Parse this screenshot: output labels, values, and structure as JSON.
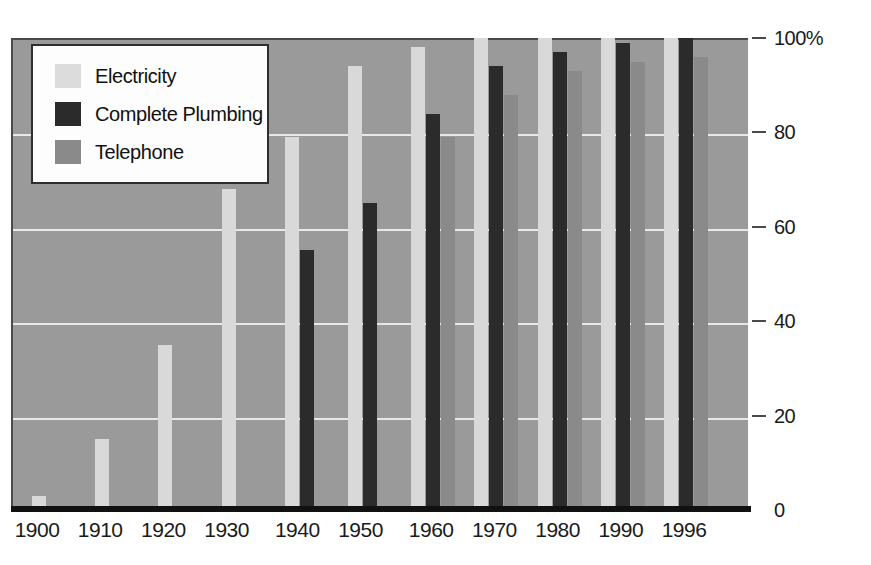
{
  "chart_data": {
    "type": "bar",
    "title": "",
    "subtitle": "",
    "xlabel": "",
    "ylabel": "",
    "ylim": [
      0,
      100
    ],
    "yticks": [
      0,
      20,
      40,
      60,
      80,
      100
    ],
    "ytick_labels": [
      "0",
      "20",
      "40",
      "60",
      "80",
      "100%"
    ],
    "grid": true,
    "legend_position": "top-left",
    "categories": [
      "1900",
      "1910",
      "1920",
      "1930",
      "1940",
      "1950",
      "1960",
      "1970",
      "1980",
      "1990",
      "1996"
    ],
    "series": [
      {
        "name": "Electricity",
        "color": "#d9d9d9",
        "values": [
          3,
          15,
          35,
          68,
          79,
          94,
          98,
          100,
          100,
          100,
          100
        ]
      },
      {
        "name": "Complete Plumbing",
        "color": "#2b2b2b",
        "values": [
          null,
          null,
          null,
          null,
          55,
          65,
          84,
          94,
          97,
          99,
          100
        ]
      },
      {
        "name": "Telephone",
        "color": "#8a8a8a",
        "values": [
          null,
          null,
          null,
          null,
          null,
          null,
          79,
          88,
          93,
          95,
          96
        ]
      }
    ]
  },
  "legend": {
    "items": [
      {
        "label": "Electricity",
        "swatch": "elec"
      },
      {
        "label": "Complete Plumbing",
        "swatch": "plumb"
      },
      {
        "label": "Telephone",
        "swatch": "tel"
      }
    ]
  },
  "colors": {
    "plot_background": "#9a9a9a",
    "gridline": "#e8e8e8",
    "baseline": "#111111",
    "frame": "#4a4a4a",
    "electricity": "#d9d9d9",
    "plumbing": "#2b2b2b",
    "telephone": "#8a8a8a",
    "legend_background": "#fdfdfd",
    "text": "#1a1a1a"
  }
}
